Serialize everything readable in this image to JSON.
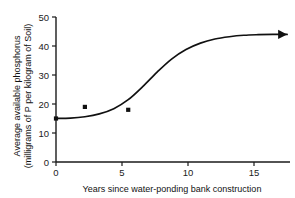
{
  "chart_data": {
    "type": "line",
    "title": "",
    "xlabel": "Years since water-ponding bank construction",
    "ylabel_line1": "Average available phosphorus",
    "ylabel_line2": "(milligrams of P per kilogram of Soil)",
    "xlim": [
      0,
      16.2
    ],
    "ylim": [
      0,
      50
    ],
    "xticks": [
      0,
      5,
      10,
      15
    ],
    "xtick_labels": [
      "0",
      "5",
      "10",
      "15"
    ],
    "yticks": [
      0,
      10,
      20,
      30,
      40,
      50
    ],
    "ytick_labels": [
      "0",
      "10",
      "20",
      "30",
      "40",
      "50"
    ],
    "grid": false,
    "legend": false,
    "series": [
      {
        "name": "Measured soil phosphorus",
        "type": "scatter",
        "marker": "square",
        "color": "#111111",
        "x": [
          0,
          2,
          5
        ],
        "y": [
          15,
          19,
          18
        ]
      },
      {
        "name": "Fitted trend (arrow indicates continuation)",
        "type": "line",
        "color": "#111111",
        "arrow_end": true,
        "x": [
          0,
          1,
          2,
          3,
          4,
          5,
          6,
          7,
          8,
          9,
          10,
          11,
          12,
          13,
          14,
          15,
          16
        ],
        "y": [
          15,
          15.1,
          15.6,
          16.6,
          18.4,
          21.5,
          26.0,
          31.0,
          35.5,
          38.8,
          41.0,
          42.4,
          43.2,
          43.7,
          43.9,
          44.0,
          44.0
        ]
      }
    ]
  }
}
